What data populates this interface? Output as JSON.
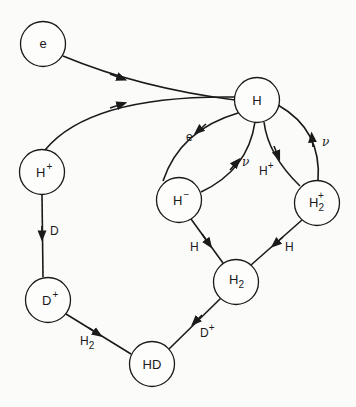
{
  "diagram": {
    "type": "reaction-network",
    "nodes": [
      {
        "id": "e",
        "label": "e",
        "sup": "",
        "sub": "",
        "cx": 43,
        "cy": 44
      },
      {
        "id": "H",
        "label": "H",
        "sup": "",
        "sub": "",
        "cx": 257,
        "cy": 100
      },
      {
        "id": "Hp",
        "label": "H",
        "sup": "+",
        "sub": "",
        "cx": 42,
        "cy": 172
      },
      {
        "id": "Hm",
        "label": "H",
        "sup": "−",
        "sub": "",
        "cx": 179,
        "cy": 200
      },
      {
        "id": "H2p",
        "label": "H",
        "sup": "+",
        "sub": "2",
        "cx": 317,
        "cy": 203
      },
      {
        "id": "H2",
        "label": "H",
        "sup": "",
        "sub": "2",
        "cx": 236,
        "cy": 282
      },
      {
        "id": "Dp",
        "label": "D",
        "sup": "+",
        "sub": "",
        "cx": 48,
        "cy": 300
      },
      {
        "id": "HD",
        "label": "HD",
        "sup": "",
        "sub": "",
        "cx": 152,
        "cy": 364
      }
    ],
    "edges": [
      {
        "from": "e",
        "to": "H",
        "label": ""
      },
      {
        "from": "Hp",
        "to": "H",
        "label": ""
      },
      {
        "from": "H",
        "to": "Hm",
        "label": "e"
      },
      {
        "from": "Hm",
        "to": "H",
        "label": "ν"
      },
      {
        "from": "H",
        "to": "H2p",
        "label": "H+"
      },
      {
        "from": "H2p",
        "to": "H",
        "label": "ν"
      },
      {
        "from": "Hm",
        "to": "H2",
        "label": "H"
      },
      {
        "from": "H2p",
        "to": "H2",
        "label": "H"
      },
      {
        "from": "Hp",
        "to": "Dp",
        "label": "D"
      },
      {
        "from": "H2",
        "to": "HD",
        "label": "D+"
      },
      {
        "from": "Dp",
        "to": "HD",
        "label": "H2"
      }
    ]
  },
  "labels": {
    "node_e": "e",
    "node_H": "H",
    "node_Hp_base": "H",
    "node_Hp_sup": "+",
    "node_Hm_base": "H",
    "node_Hm_sup": "−",
    "node_H2p_base": "H",
    "node_H2p_sub": "2",
    "node_H2p_sup": "+",
    "node_H2_base": "H",
    "node_H2_sub": "2",
    "node_Dp_base": "D",
    "node_Dp_sup": "+",
    "node_HD": "HD",
    "edge_H_Hm": "e",
    "edge_Hm_H": "ν",
    "edge_H_H2p_base": "H",
    "edge_H_H2p_sup": "+",
    "edge_H2p_H": "ν",
    "edge_Hm_H2": "H",
    "edge_H2p_H2": "H",
    "edge_Hp_Dp": "D",
    "edge_H2_HD_base": "D",
    "edge_H2_HD_sup": "+",
    "edge_Dp_HD_base": "H",
    "edge_Dp_HD_sub": "2"
  },
  "colors": {
    "line": "#1a1a1a",
    "background": "#fbfbfa"
  }
}
